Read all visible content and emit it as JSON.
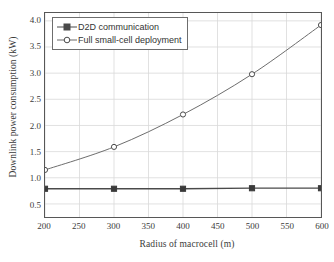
{
  "chart_data": {
    "type": "line",
    "title": "",
    "xlabel": "Radius of macrocell (m)",
    "ylabel": "Downlink power consumption (kW)",
    "xlim": [
      200,
      600
    ],
    "ylim": [
      0.25,
      4.15
    ],
    "xticks": [
      200,
      250,
      300,
      350,
      400,
      450,
      500,
      550,
      600
    ],
    "yticks": [
      0.5,
      1.0,
      1.5,
      2.0,
      2.5,
      3.0,
      3.5,
      4.0
    ],
    "xtick_labels": [
      "200",
      "250",
      "300",
      "350",
      "400",
      "450",
      "500",
      "550",
      "600"
    ],
    "ytick_labels": [
      "0.5",
      "1.0",
      "1.5",
      "2.0",
      "2.5",
      "3.0",
      "3.5",
      "4.0"
    ],
    "grid": true,
    "legend_position": "upper left",
    "x": [
      200,
      300,
      400,
      500,
      600
    ],
    "series": [
      {
        "name": "D2D communication",
        "marker": "filled-square",
        "color": "#4a4a4a",
        "values": [
          0.79,
          0.79,
          0.79,
          0.8,
          0.8
        ]
      },
      {
        "name": "Full small-cell deployment",
        "marker": "open-circle",
        "color": "#6b6b6b",
        "values": [
          1.15,
          1.59,
          2.21,
          2.98,
          3.92
        ]
      }
    ]
  },
  "legend": {
    "items": [
      {
        "label": "D2D communication"
      },
      {
        "label": "Full small-cell deployment"
      }
    ]
  },
  "colors": {
    "axis": "#575757",
    "grid": "#d9d9d9",
    "series_d2d": "#4a4a4a",
    "series_smallcell": "#6b6b6b",
    "background": "#ffffff"
  }
}
